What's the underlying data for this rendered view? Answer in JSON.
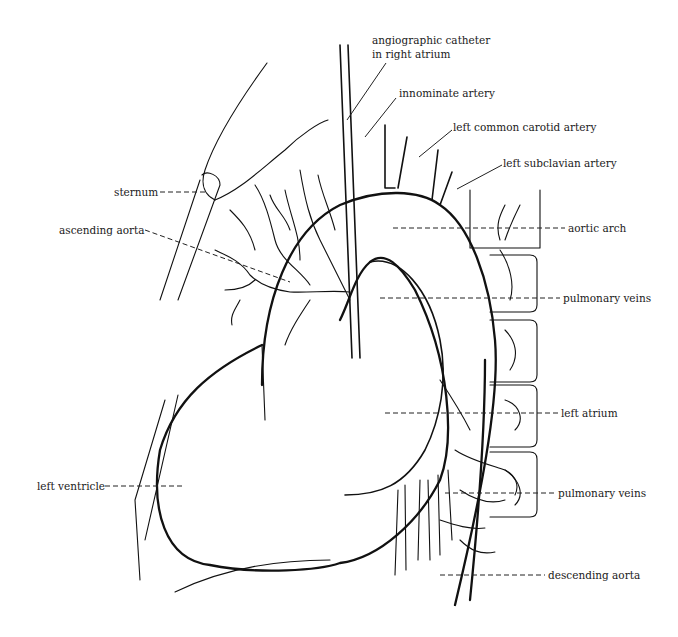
{
  "diagram": {
    "colors": {
      "ink": "#111111",
      "background": "#ffffff"
    },
    "labels": {
      "catheter_line1": "angiographic catheter",
      "catheter_line2": "in right atrium",
      "innominate": "innominate artery",
      "left_common_carotid": "left common carotid artery",
      "left_subclavian": "left subclavian artery",
      "sternum": "sternum",
      "ascending_aorta": "ascending aorta",
      "aortic_arch": "aortic arch",
      "pulmonary_veins_upper": "pulmonary veins",
      "left_atrium": "left atrium",
      "left_ventricle": "left ventricle",
      "pulmonary_veins_lower": "pulmonary veins",
      "descending_aorta": "descending aorta"
    }
  }
}
